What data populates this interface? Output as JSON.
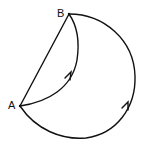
{
  "diagram": {
    "points": {
      "A": {
        "label": "A",
        "x": 20,
        "y": 106
      },
      "B": {
        "label": "B",
        "x": 69,
        "y": 14
      }
    },
    "paths": [
      {
        "name": "straight-chord",
        "from": "A",
        "to": "B",
        "type": "line"
      },
      {
        "name": "inner-arc",
        "from": "A",
        "to": "B",
        "type": "curve",
        "arrow": "toward B"
      },
      {
        "name": "outer-arc",
        "from": "A",
        "to": "B",
        "type": "curve",
        "arrow": "toward B"
      }
    ],
    "stroke_color": "#111111",
    "background": "#ffffff"
  }
}
